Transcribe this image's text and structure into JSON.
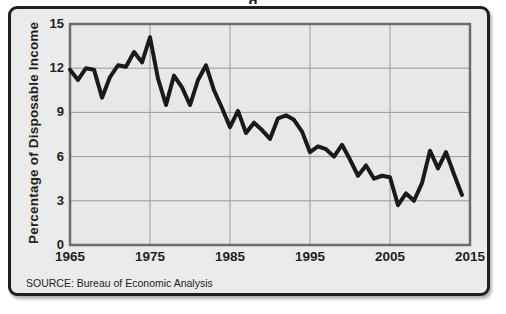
{
  "figure": {
    "title_partial": "g",
    "source": "SOURCE: Bureau of Economic Analysis",
    "border_color": "#231f20",
    "background_color": "#ebebeb",
    "plot_background_color": "#e8e8e8"
  },
  "chart_data": {
    "type": "line",
    "title": "",
    "xlabel": "",
    "ylabel": "Percentage  of  Disposable Income",
    "xlim": [
      1965,
      2015
    ],
    "ylim": [
      0,
      15
    ],
    "grid": true,
    "legend": null,
    "line_color": "#1a1a1a",
    "line_width": 4,
    "xticks": [
      "1965",
      "1975",
      "1985",
      "1995",
      "2005",
      "2015"
    ],
    "xtick_values": [
      1965,
      1975,
      1985,
      1995,
      2005,
      2015
    ],
    "yticks": [
      "0",
      "3",
      "6",
      "9",
      "12",
      "15"
    ],
    "ytick_values": [
      0,
      3,
      6,
      9,
      12,
      15
    ],
    "x": [
      1965,
      1966,
      1967,
      1968,
      1969,
      1970,
      1971,
      1972,
      1973,
      1974,
      1975,
      1976,
      1977,
      1978,
      1979,
      1980,
      1981,
      1982,
      1983,
      1984,
      1985,
      1986,
      1987,
      1988,
      1989,
      1990,
      1991,
      1992,
      1993,
      1994,
      1995,
      1996,
      1997,
      1998,
      1999,
      2000,
      2001,
      2002,
      2003,
      2004,
      2005,
      2006,
      2007,
      2008,
      2009,
      2010,
      2011,
      2012,
      2013,
      2014
    ],
    "values": [
      11.9,
      11.2,
      12.0,
      11.9,
      10.0,
      11.4,
      12.2,
      12.1,
      13.1,
      12.4,
      14.1,
      11.3,
      9.5,
      11.5,
      10.7,
      9.5,
      11.2,
      12.2,
      10.5,
      9.3,
      8.0,
      9.1,
      7.6,
      8.3,
      7.8,
      7.2,
      8.6,
      8.8,
      8.5,
      7.7,
      6.3,
      6.7,
      6.5,
      6.0,
      6.8,
      5.8,
      4.7,
      5.4,
      4.5,
      4.7,
      4.6,
      2.7,
      3.5,
      3.0,
      4.2,
      6.4,
      5.2,
      6.3,
      4.8,
      3.4
    ]
  }
}
